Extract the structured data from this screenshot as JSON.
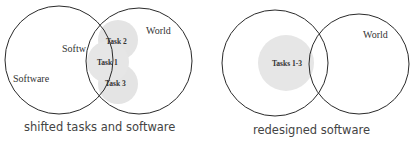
{
  "diagrams": [
    {
      "caption": "shifted tasks and software",
      "circles": {
        "software": {
          "label": "Software",
          "inner_label": "Softw"
        },
        "world": {
          "label": "World"
        }
      },
      "tasks": [
        {
          "label": "Task 2"
        },
        {
          "label": "Task 1"
        },
        {
          "label": "Task 3"
        }
      ]
    },
    {
      "caption": "redesigned software",
      "circles": {
        "software": {
          "label": ""
        },
        "world": {
          "label": "World"
        }
      },
      "tasks": [
        {
          "label": "Tasks 1-3"
        }
      ]
    }
  ],
  "colors": {
    "stroke": "#2a2a2a",
    "task_fill": "#e4e4e4",
    "text": "#333333"
  }
}
